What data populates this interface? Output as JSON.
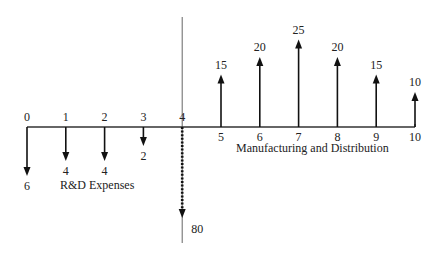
{
  "chart_data": {
    "type": "cash-flow-diagram",
    "title": "",
    "periods": [
      0,
      1,
      2,
      3,
      4,
      5,
      6,
      7,
      8,
      9,
      10
    ],
    "flows": [
      {
        "period": 0,
        "value": -6,
        "label": "6",
        "style": "solid"
      },
      {
        "period": 1,
        "value": -4,
        "label": "4",
        "style": "solid"
      },
      {
        "period": 2,
        "value": -4,
        "label": "4",
        "style": "solid"
      },
      {
        "period": 3,
        "value": -2,
        "label": "2",
        "style": "solid"
      },
      {
        "period": 4,
        "value": -80,
        "label": "80",
        "style": "dotted"
      },
      {
        "period": 5,
        "value": 15,
        "label": "15",
        "style": "solid"
      },
      {
        "period": 6,
        "value": 20,
        "label": "20",
        "style": "solid"
      },
      {
        "period": 7,
        "value": 25,
        "label": "25",
        "style": "solid"
      },
      {
        "period": 8,
        "value": 20,
        "label": "20",
        "style": "solid"
      },
      {
        "period": 9,
        "value": 15,
        "label": "15",
        "style": "solid"
      },
      {
        "period": 10,
        "value": 10,
        "label": "10",
        "style": "solid"
      }
    ],
    "annotations": {
      "left": "R&D Expenses",
      "right": "Manufacturing and Distribution"
    },
    "divider_period": 4
  }
}
